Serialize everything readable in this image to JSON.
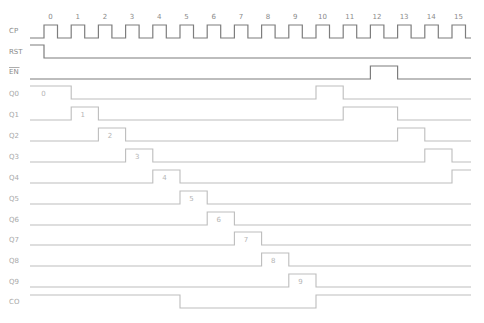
{
  "diagram": {
    "clock_ticks": [
      "0",
      "1",
      "2",
      "3",
      "4",
      "5",
      "6",
      "7",
      "8",
      "9",
      "10",
      "11",
      "12",
      "13",
      "14",
      "15"
    ],
    "signals": [
      {
        "name": "CP",
        "label": "CP",
        "style": "dark",
        "type": "clock"
      },
      {
        "name": "RST",
        "label": "RST",
        "style": "dark",
        "type": "levels",
        "start": 1,
        "transitions": [
          0
        ]
      },
      {
        "name": "EN",
        "label": "EN",
        "overbar": true,
        "style": "dark",
        "type": "levels",
        "start": 0,
        "transitions": [
          12,
          13
        ]
      },
      {
        "name": "Q0",
        "label": "Q0",
        "style": "light",
        "type": "levels",
        "start": 1,
        "transitions": [
          1,
          10,
          11
        ],
        "values": [
          {
            "text": "0",
            "at": 0.2
          }
        ]
      },
      {
        "name": "Q1",
        "label": "Q1",
        "style": "light",
        "type": "levels",
        "start": 0,
        "transitions": [
          1,
          2,
          11,
          13
        ],
        "values": [
          {
            "text": "1",
            "at": 1.5
          }
        ]
      },
      {
        "name": "Q2",
        "label": "Q2",
        "style": "light",
        "type": "levels",
        "start": 0,
        "transitions": [
          2,
          3,
          13,
          14
        ],
        "values": [
          {
            "text": "2",
            "at": 2.5
          }
        ]
      },
      {
        "name": "Q3",
        "label": "Q3",
        "style": "light",
        "type": "levels",
        "start": 0,
        "transitions": [
          3,
          4,
          14,
          15
        ],
        "values": [
          {
            "text": "3",
            "at": 3.5
          }
        ]
      },
      {
        "name": "Q4",
        "label": "Q4",
        "style": "light",
        "type": "levels",
        "start": 0,
        "transitions": [
          4,
          5,
          15
        ],
        "values": [
          {
            "text": "4",
            "at": 4.5
          }
        ]
      },
      {
        "name": "Q5",
        "label": "Q5",
        "style": "light",
        "type": "levels",
        "start": 0,
        "transitions": [
          5,
          6
        ],
        "values": [
          {
            "text": "5",
            "at": 5.5
          }
        ]
      },
      {
        "name": "Q6",
        "label": "Q6",
        "style": "light",
        "type": "levels",
        "start": 0,
        "transitions": [
          6,
          7
        ],
        "values": [
          {
            "text": "6",
            "at": 6.5
          }
        ]
      },
      {
        "name": "Q7",
        "label": "Q7",
        "style": "light",
        "type": "levels",
        "start": 0,
        "transitions": [
          7,
          8
        ],
        "values": [
          {
            "text": "7",
            "at": 7.5
          }
        ]
      },
      {
        "name": "Q8",
        "label": "Q8",
        "style": "light",
        "type": "levels",
        "start": 0,
        "transitions": [
          8,
          9
        ],
        "values": [
          {
            "text": "8",
            "at": 8.5
          }
        ]
      },
      {
        "name": "Q9",
        "label": "Q9",
        "style": "light",
        "type": "levels",
        "start": 0,
        "transitions": [
          9,
          10
        ],
        "values": [
          {
            "text": "9",
            "at": 9.5
          }
        ]
      },
      {
        "name": "CO",
        "label": "CO",
        "style": "light",
        "type": "levels",
        "start": 1,
        "transitions": [
          5,
          10
        ]
      }
    ],
    "colors": {
      "dark_wave": "#7d7d7d",
      "light_wave": "#bdbdbd",
      "label": "#8a8a8a"
    }
  }
}
